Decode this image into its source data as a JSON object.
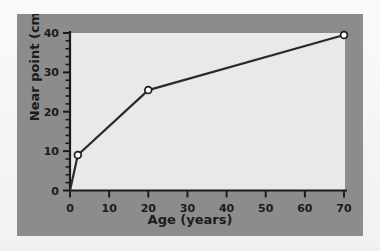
{
  "figure": {
    "panel_color": "#8c8c8c",
    "plot_background": "#e9e9e9",
    "mat_color": "#f4f4f4",
    "ink_color": "#1b1b1b"
  },
  "chart_data": {
    "type": "line",
    "title": "",
    "xlabel": "Age (years)",
    "ylabel": "Near point (cm)",
    "xlim": [
      0,
      70
    ],
    "ylim": [
      0,
      40
    ],
    "grid": false,
    "legend": null,
    "x_major_ticks": [
      0,
      10,
      20,
      30,
      40,
      50,
      60,
      70
    ],
    "x_tick_labels": [
      "0",
      "10",
      "20",
      "30",
      "40",
      "50",
      "60",
      "70"
    ],
    "y_major_ticks": [
      0,
      10,
      20,
      30,
      40
    ],
    "y_tick_labels": [
      "0",
      "10",
      "20",
      "30",
      "40"
    ],
    "y_minor_tick_step": 2,
    "marker_style": "open-circle",
    "marker_face_color": "#ffffff",
    "marker_edge_color": "#1b1b1b",
    "line_color": "#2a2a2a",
    "line_width": 2.2,
    "series": [
      {
        "name": "Near point of vision",
        "x": [
          0,
          2,
          20,
          70
        ],
        "values": [
          0,
          9,
          25.5,
          39.5
        ],
        "markers_shown": [
          false,
          true,
          true,
          true
        ]
      }
    ]
  }
}
